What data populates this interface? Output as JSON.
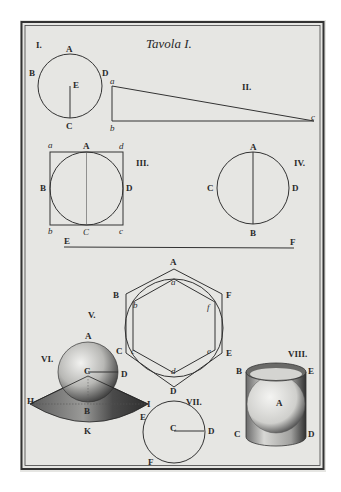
{
  "plate": {
    "title": "Tavola I.",
    "paper_color": "#e6e6e3",
    "ink_color": "#2a2a2a"
  },
  "figures": {
    "I": {
      "number": "I.",
      "labels": {
        "A": "A",
        "B": "B",
        "D": "D",
        "E": "E",
        "C": "C"
      }
    },
    "II": {
      "number": "II.",
      "labels": {
        "a": "a",
        "b": "b",
        "c": "c"
      }
    },
    "III": {
      "number": "III.",
      "labels": {
        "a": "a",
        "A": "A",
        "d": "d",
        "B": "B",
        "D": "D",
        "b": "b",
        "C": "C",
        "c": "c"
      }
    },
    "IV": {
      "number": "IV.",
      "labels": {
        "A": "A",
        "C": "C",
        "D": "D",
        "B": "B"
      }
    },
    "EF": {
      "labels": {
        "E": "E",
        "F": "F"
      }
    },
    "V": {
      "number": "V.",
      "labels": {
        "A": "A",
        "a": "a",
        "B": "B",
        "b": "b",
        "F": "F",
        "f": "f",
        "C": "C",
        "c": "c",
        "E": "E",
        "e": "e",
        "d": "d",
        "D": "D"
      }
    },
    "VI": {
      "number": "VI.",
      "labels": {
        "A": "A",
        "C": "C",
        "D": "D",
        "H": "H",
        "B": "B",
        "I": "I",
        "K": "K"
      }
    },
    "VII": {
      "number": "VII.",
      "labels": {
        "E": "E",
        "C": "C",
        "D": "D",
        "F": "F"
      }
    },
    "VIII": {
      "number": "VIII.",
      "labels": {
        "B": "B",
        "E": "E",
        "A": "A",
        "C": "C",
        "D": "D"
      }
    }
  }
}
